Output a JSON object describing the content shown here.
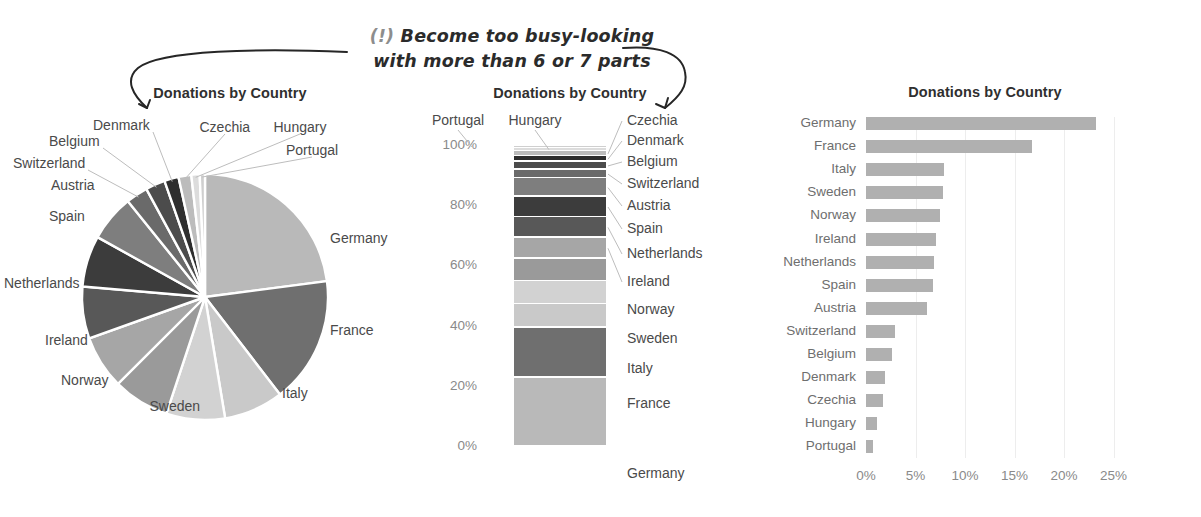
{
  "annotation": {
    "marker": "(!)",
    "line1": "Become too busy-looking",
    "line2": "with more than 6 or 7 parts"
  },
  "pie_chart": {
    "title": "Donations by Country",
    "labels": [
      "Germany",
      "France",
      "Italy",
      "Sweden",
      "Norway",
      "Ireland",
      "Netherlands",
      "Spain",
      "Austria",
      "Switzerland",
      "Belgium",
      "Denmark",
      "Czechia",
      "Hungary",
      "Portugal"
    ]
  },
  "stacked_chart": {
    "title": "Donations by Country",
    "y_ticks": [
      "100%",
      "80%",
      "60%",
      "40%",
      "20%",
      "0%"
    ],
    "labels": [
      "Portugal",
      "Hungary",
      "Czechia",
      "Denmark",
      "Belgium",
      "Switzerland",
      "Austria",
      "Spain",
      "Netherlands",
      "Ireland",
      "Norway",
      "Sweden",
      "Italy",
      "France",
      "Germany"
    ]
  },
  "bar_chart": {
    "title": "Donations by Country",
    "x_ticks": [
      "0%",
      "5%",
      "10%",
      "15%",
      "20%",
      "25%"
    ],
    "x_axis_label": "% of total"
  },
  "chart_data": [
    {
      "type": "pie",
      "title": "Donations by Country",
      "categories": [
        "Germany",
        "France",
        "Italy",
        "Sweden",
        "Norway",
        "Ireland",
        "Netherlands",
        "Spain",
        "Austria",
        "Switzerland",
        "Belgium",
        "Denmark",
        "Czechia",
        "Hungary",
        "Portugal"
      ],
      "values": [
        23.2,
        16.8,
        7.9,
        7.8,
        7.5,
        7.1,
        6.9,
        6.8,
        6.2,
        2.9,
        2.6,
        1.9,
        1.7,
        1.1,
        0.7
      ],
      "unit": "% of total",
      "legend": "labels with leader lines",
      "colors": [
        "#b9b9b9",
        "#6f6f6f",
        "#c9c9c9",
        "#d2d2d2",
        "#9a9a9a",
        "#a6a6a6",
        "#585858",
        "#3c3c3c",
        "#7e7e7e",
        "#6a6a6a",
        "#4c4c4c",
        "#2e2e2e",
        "#bcbcbc",
        "#dcdcdc",
        "#cfcfcf"
      ]
    },
    {
      "type": "bar",
      "subtype": "stacked-100",
      "title": "Donations by Country",
      "categories": [
        "Donations"
      ],
      "stack_order_bottom_to_top": [
        "Germany",
        "France",
        "Italy",
        "Sweden",
        "Norway",
        "Ireland",
        "Netherlands",
        "Spain",
        "Austria",
        "Switzerland",
        "Belgium",
        "Denmark",
        "Czechia",
        "Hungary",
        "Portugal"
      ],
      "values": [
        23.2,
        16.8,
        7.9,
        7.8,
        7.5,
        7.1,
        6.9,
        6.8,
        6.2,
        2.9,
        2.6,
        1.9,
        1.7,
        1.1,
        0.7
      ],
      "ylabel": "",
      "ylim": [
        0,
        100
      ],
      "ytick_values": [
        100,
        80,
        60,
        40,
        20,
        0
      ],
      "grid": false
    },
    {
      "type": "bar",
      "subtype": "horizontal",
      "title": "Donations by Country",
      "categories": [
        "Germany",
        "France",
        "Italy",
        "Sweden",
        "Norway",
        "Ireland",
        "Netherlands",
        "Spain",
        "Austria",
        "Switzerland",
        "Belgium",
        "Denmark",
        "Czechia",
        "Hungary",
        "Portugal"
      ],
      "values": [
        23.2,
        16.8,
        7.9,
        7.8,
        7.5,
        7.1,
        6.9,
        6.8,
        6.2,
        2.9,
        2.6,
        1.9,
        1.7,
        1.1,
        0.7
      ],
      "xlabel": "% of total",
      "ylabel": "",
      "xlim": [
        0,
        27
      ],
      "xtick_values": [
        0,
        5,
        10,
        15,
        20,
        25
      ],
      "grid": true,
      "bar_color": "#b0b0b0"
    }
  ]
}
